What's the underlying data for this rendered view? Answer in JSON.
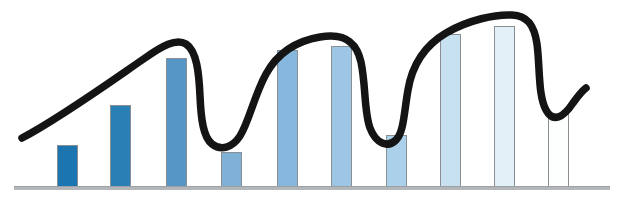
{
  "chart_data": {
    "type": "bar",
    "title": "",
    "subtitle": "",
    "xlabel": "",
    "ylabel": "",
    "grid": false,
    "legend": false,
    "legend_position": "none",
    "axis": {
      "x_visible": true,
      "y_visible": false,
      "baseline_color": "#b3b7ba",
      "xlim": [
        0,
        10
      ],
      "ylim": [
        0,
        100
      ]
    },
    "categories": [
      "1",
      "2",
      "3",
      "4",
      "5",
      "6",
      "7",
      "8",
      "9",
      "10"
    ],
    "tick_labels": [],
    "values": [
      21,
      41,
      64,
      18,
      68,
      70,
      26,
      76,
      80,
      37
    ],
    "bar_colors": [
      "#1b75b0",
      "#2a7fb5",
      "#5596c7",
      "#7fb0d6",
      "#86b7dc",
      "#9cc6e4",
      "#abd0e9",
      "#c8e1f1",
      "#e2f0f7",
      "#fdfefe"
    ],
    "bar_border_color": "#8a8f93",
    "annotations": [
      {
        "name": "hand-drawn-trend-curve",
        "type": "freehand-curve",
        "color": "#141414",
        "stroke_width": 7,
        "description": "Thick black hand-drawn wavy trend line rising from lower-left across the bars with two deep dips and a final hook"
      }
    ],
    "series": [
      {
        "name": "bars",
        "values": [
          21,
          41,
          64,
          18,
          68,
          70,
          26,
          76,
          80,
          37
        ]
      }
    ]
  },
  "figure": {
    "background_color": "#ffffff",
    "accent_color": "#1b75b0",
    "curve_color": "#141414"
  }
}
